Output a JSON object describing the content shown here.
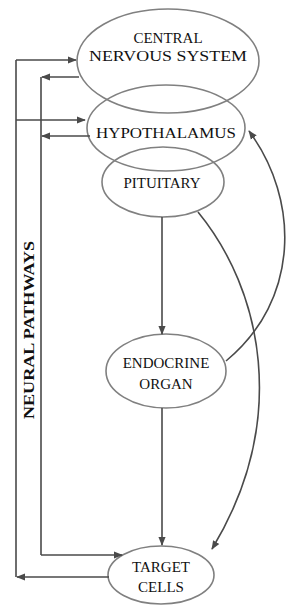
{
  "diagram": {
    "title": "",
    "colors": {
      "node_stroke": "#808080",
      "edge": "#4a4a4a",
      "text": "#111111",
      "background": "#ffffff"
    },
    "nodes": {
      "cns": {
        "line1": "CENTRAL",
        "line2": "NERVOUS SYSTEM"
      },
      "hypothalamus": {
        "label": "HYPOTHALAMUS"
      },
      "pituitary": {
        "label": "PITUITARY"
      },
      "endocrine": {
        "line1": "ENDOCRINE",
        "line2": "ORGAN"
      },
      "target": {
        "line1": "TARGET",
        "line2": "CELLS"
      }
    },
    "side_label": "NEURAL PATHWAYS",
    "edges": [
      {
        "from": "Neural pathways (outer)",
        "to": "Central Nervous System"
      },
      {
        "from": "Central Nervous System",
        "to": "Neural pathways (inner)"
      },
      {
        "from": "Neural pathways (outer)",
        "to": "Hypothalamus"
      },
      {
        "from": "Hypothalamus",
        "to": "Neural pathways (inner)"
      },
      {
        "from": "Neural pathways (inner)",
        "to": "Target Cells"
      },
      {
        "from": "Target Cells",
        "to": "Neural pathways (outer)"
      },
      {
        "from": "Pituitary",
        "to": "Endocrine Organ"
      },
      {
        "from": "Pituitary",
        "to": "Target Cells"
      },
      {
        "from": "Endocrine Organ",
        "to": "Target Cells"
      },
      {
        "from": "Endocrine Organ",
        "to": "Hypothalamus"
      }
    ]
  }
}
